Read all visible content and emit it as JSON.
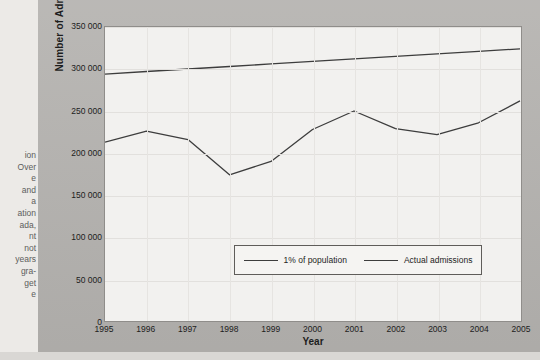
{
  "margin_text": {
    "lines": [
      "ion",
      "Over",
      "e",
      "and",
      "a",
      "ation",
      "ada,",
      "nt",
      "not",
      "years",
      "gra-",
      "get",
      "e"
    ]
  },
  "figure": {
    "y_axis_title": "Number of Admissions",
    "x_axis_title": "Year",
    "y_ticks": [
      "0",
      "50 000",
      "100 000",
      "150 000",
      "200 000",
      "250 000",
      "300 000",
      "350 000"
    ],
    "x_ticks": [
      "1995",
      "1996",
      "1997",
      "1998",
      "1999",
      "2000",
      "2001",
      "2002",
      "2003",
      "2004",
      "2005"
    ],
    "legend": [
      {
        "label": "1% of population"
      },
      {
        "label": "Actual admissions"
      }
    ]
  },
  "colors": {
    "panel": "#b6b4b1",
    "plot_bg": "#f2f1ef",
    "line": "#3d3d3d",
    "grid": "#e2e0dd",
    "text": "#1d1d1d"
  },
  "chart_data": {
    "type": "line",
    "title": "",
    "xlabel": "Year",
    "ylabel": "Number of Admissions",
    "categories": [
      "1995",
      "1996",
      "1997",
      "1998",
      "1999",
      "2000",
      "2001",
      "2002",
      "2003",
      "2004",
      "2005"
    ],
    "x": [
      1995,
      1996,
      1997,
      1998,
      1999,
      2000,
      2001,
      2002,
      2003,
      2004,
      2005
    ],
    "xlim": [
      1995,
      2005
    ],
    "ylim": [
      0,
      350000
    ],
    "ytick_values": [
      0,
      50000,
      100000,
      150000,
      200000,
      250000,
      300000,
      350000
    ],
    "grid": true,
    "legend_position": "inside-bottom-center",
    "series": [
      {
        "name": "1% of population",
        "values": [
          294000,
          297000,
          300000,
          303000,
          306000,
          309000,
          312000,
          315000,
          318000,
          321000,
          324000
        ]
      },
      {
        "name": "Actual admissions",
        "values": [
          213000,
          226000,
          216000,
          174000,
          190000,
          228000,
          250000,
          229000,
          222000,
          236000,
          262000
        ]
      }
    ]
  }
}
